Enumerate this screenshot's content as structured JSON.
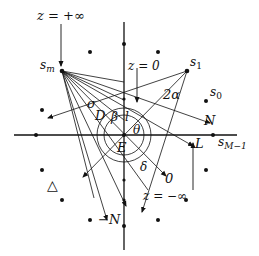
{
  "diagram": {
    "type": "geometric-construction",
    "labels": {
      "z_plus_inf": "z = +∞",
      "z_zero": "z = 0",
      "z_minus_inf": "z = −∞",
      "s_m": "s",
      "s_m_sub": "m",
      "s_1": "s",
      "s_1_sub": "1",
      "s_0": "s",
      "s_0_sub": "0",
      "s_M1": "s",
      "s_M1_sub": "M−1",
      "sigma": "σ",
      "two_alpha": "2α",
      "D": "D",
      "beta": "β",
      "l": "l",
      "theta": "θ",
      "N": "N",
      "L": "L",
      "E": "E",
      "delta": "δ",
      "zero": "0",
      "minus_N": "−N",
      "triangle": "△"
    },
    "points": [
      {
        "name": "s_m",
        "x": 62,
        "y": 71
      },
      {
        "name": "s_1",
        "x": 187,
        "y": 71
      },
      {
        "name": "s_0",
        "x": 206,
        "y": 101
      },
      {
        "name": "s_M-1",
        "x": 213,
        "y": 135
      },
      {
        "name": "origin-E",
        "x": 124,
        "y": 135
      }
    ],
    "scatter_dots": [
      [
        90,
        52
      ],
      [
        124,
        44
      ],
      [
        158,
        52
      ],
      [
        42,
        110
      ],
      [
        36,
        135
      ],
      [
        42,
        170
      ],
      [
        62,
        200
      ],
      [
        90,
        220
      ],
      [
        124,
        226
      ],
      [
        158,
        220
      ],
      [
        186,
        200
      ],
      [
        206,
        170
      ],
      [
        124,
        190
      ]
    ]
  }
}
